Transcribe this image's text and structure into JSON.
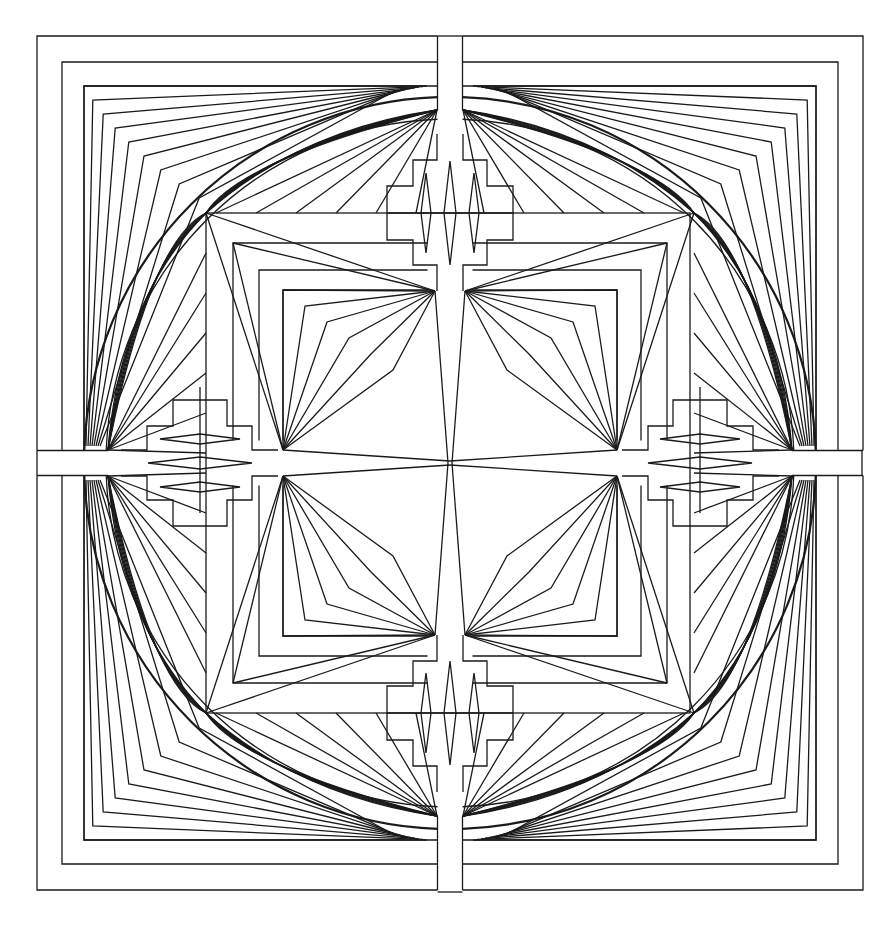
{
  "artwork": {
    "title": "Geometric mandala line art",
    "width": 874,
    "height": 943,
    "stroke_color": "#1a1a1a",
    "background": "#ffffff",
    "center": [
      450,
      463
    ],
    "frames": {
      "outer": [
        37,
        36,
        862,
        892
      ],
      "second": [
        62,
        62,
        837,
        868
      ],
      "third": [
        84,
        86,
        815,
        842
      ]
    },
    "cross_bar_half_width": 12.5,
    "circle": {
      "cx": 450,
      "cy": 463,
      "r_outer": 366,
      "r_inner": 344
    },
    "inner_square": [
      206,
      213,
      690,
      713
    ],
    "quadrant_fan_apexes": {
      "outer_corner": [
        437,
        110
      ],
      "side": [
        108,
        450
      ],
      "square_corner": [
        206,
        213
      ],
      "inner": [
        435,
        291
      ],
      "inner_side": [
        283,
        450
      ]
    },
    "step_motif": {
      "steps_x": [
        437,
        413,
        387
      ],
      "steps_y": [
        134,
        160,
        186,
        213,
        240,
        265,
        291
      ],
      "diamonds": [
        {
          "cx": 426,
          "cy": 213,
          "w": 10,
          "h": 80
        },
        {
          "cx": 450,
          "cy": 213,
          "w": 12,
          "h": 104
        },
        {
          "cx": 474,
          "cy": 213,
          "w": 10,
          "h": 80
        }
      ]
    }
  }
}
